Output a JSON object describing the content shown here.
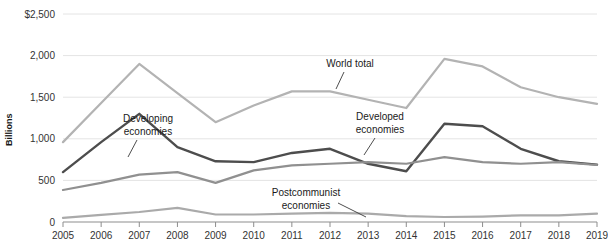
{
  "chart_data": {
    "type": "line",
    "title": "",
    "xlabel": "",
    "ylabel": "Billions",
    "x": [
      2005,
      2006,
      2007,
      2008,
      2009,
      2010,
      2011,
      2012,
      2013,
      2014,
      2015,
      2016,
      2017,
      2018,
      2019
    ],
    "xticklabels": [
      "2005",
      "2006",
      "2007",
      "2008",
      "2009",
      "2010",
      "2011",
      "2012",
      "2013",
      "2014",
      "2015",
      "2016",
      "2017",
      "2018",
      "2019"
    ],
    "yticklabels": [
      "$2,500",
      "2,000",
      "1,500",
      "1,000",
      "500",
      "0"
    ],
    "ytickvalues": [
      2500,
      2000,
      1500,
      1000,
      500,
      0
    ],
    "ylim": [
      0,
      2500
    ],
    "xlim": [
      2005,
      2019
    ],
    "grid": true,
    "legend_position": "inline-annotations",
    "series": [
      {
        "name": "World total",
        "color": "#b3b3b3",
        "values": [
          960,
          1430,
          1900,
          1550,
          1200,
          1400,
          1570,
          1570,
          1470,
          1370,
          1960,
          1870,
          1620,
          1500,
          1420
        ]
      },
      {
        "name": "Developed economies",
        "color": "#4d4d4d",
        "values": [
          600,
          960,
          1300,
          900,
          730,
          720,
          830,
          880,
          700,
          610,
          1180,
          1150,
          880,
          730,
          690
        ]
      },
      {
        "name": "Developing economies",
        "color": "#909090",
        "values": [
          385,
          470,
          570,
          600,
          470,
          620,
          680,
          700,
          720,
          700,
          780,
          720,
          700,
          720,
          685
        ]
      },
      {
        "name": "Postcommunist economies",
        "color": "#aaaaaa",
        "values": [
          50,
          85,
          120,
          170,
          90,
          90,
          100,
          110,
          100,
          70,
          60,
          65,
          80,
          80,
          100
        ]
      }
    ],
    "annotations": [
      {
        "label_line1": "World total",
        "label_line2": "",
        "name": "world-total"
      },
      {
        "label_line1": "Developed",
        "label_line2": "economies",
        "name": "developed-economies"
      },
      {
        "label_line1": "Developing",
        "label_line2": "economies",
        "name": "developing-economies"
      },
      {
        "label_line1": "Postcommunist",
        "label_line2": "economies",
        "name": "postcommunist-economies"
      }
    ]
  },
  "axis": {
    "y_title": "Billions"
  }
}
